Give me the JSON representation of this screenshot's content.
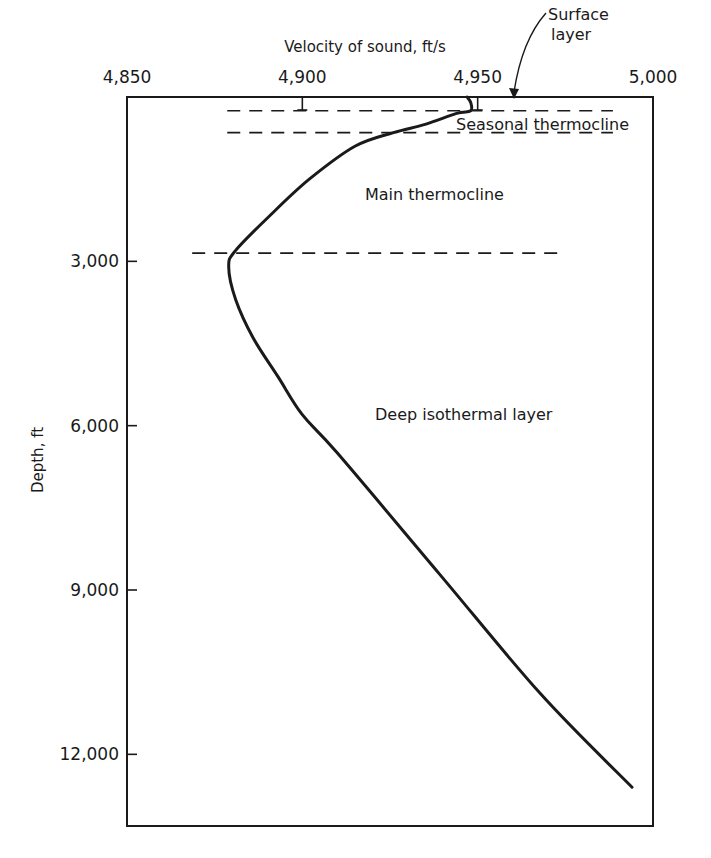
{
  "chart_data": {
    "type": "line",
    "title": "",
    "xlabel": "Velocity of sound, ft/s",
    "ylabel": "Depth, ft",
    "x_axis_position": "top",
    "y_inverted": true,
    "xlim": [
      4850,
      5000
    ],
    "ylim": [
      0,
      13200
    ],
    "x_ticks": [
      4850,
      4900,
      4950,
      5000
    ],
    "x_tick_labels": [
      "4,850",
      "4,900",
      "4,950",
      "5,000"
    ],
    "y_ticks": [
      3000,
      6000,
      9000,
      12000
    ],
    "y_tick_labels": [
      "3,000",
      "6,000",
      "9,000",
      "12,000"
    ],
    "grid": false,
    "legend": null,
    "series": [
      {
        "name": "Sound velocity profile",
        "points": [
          {
            "velocity": 4947,
            "depth": 0
          },
          {
            "velocity": 4948,
            "depth": 100
          },
          {
            "velocity": 4948,
            "depth": 250
          },
          {
            "velocity": 4944,
            "depth": 300
          },
          {
            "velocity": 4935,
            "depth": 500
          },
          {
            "velocity": 4926,
            "depth": 650
          },
          {
            "velocity": 4915,
            "depth": 900
          },
          {
            "velocity": 4902,
            "depth": 1500
          },
          {
            "velocity": 4891,
            "depth": 2150
          },
          {
            "velocity": 4881,
            "depth": 2800
          },
          {
            "velocity": 4879,
            "depth": 3100
          },
          {
            "velocity": 4881,
            "depth": 3700
          },
          {
            "velocity": 4886,
            "depth": 4400
          },
          {
            "velocity": 4893,
            "depth": 5100
          },
          {
            "velocity": 4900,
            "depth": 5800
          },
          {
            "velocity": 4910,
            "depth": 6500
          },
          {
            "velocity": 4939,
            "depth": 8700
          },
          {
            "velocity": 4968,
            "depth": 10900
          },
          {
            "velocity": 4994,
            "depth": 12600
          }
        ]
      }
    ],
    "layer_boundaries": [
      {
        "depth": 250,
        "style": "dashed",
        "x_range": [
          4890,
          4990
        ]
      },
      {
        "depth": 650,
        "style": "dashed",
        "x_range": [
          4890,
          4990
        ]
      },
      {
        "depth": 2850,
        "style": "dashed",
        "x_range": [
          4880,
          4975
        ]
      }
    ],
    "annotations": [
      {
        "text": "Surface layer",
        "velocity": 4960,
        "depth": 0,
        "arrow": true
      },
      {
        "text": "Seasonal thermocline",
        "velocity": 4943,
        "depth": 500
      },
      {
        "text": "Main thermocline",
        "velocity": 4918,
        "depth": 1800
      },
      {
        "text": "Deep isothermal layer",
        "velocity": 4921,
        "depth": 5800
      }
    ]
  },
  "labels": {
    "x_axis_title": "Velocity of sound, ft/s",
    "y_axis_title": "Depth, ft",
    "surface_line1": "Surface",
    "surface_line2": "layer",
    "seasonal": "Seasonal thermocline",
    "main": "Main thermocline",
    "deep": "Deep isothermal layer"
  }
}
